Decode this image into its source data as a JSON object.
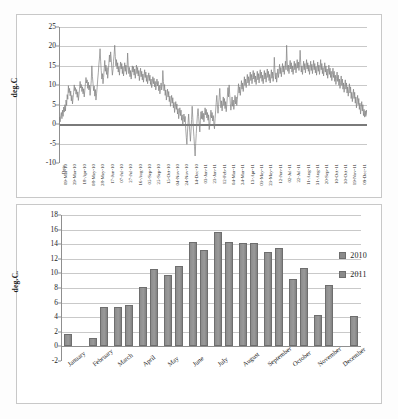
{
  "figure": {
    "charts": [
      {
        "id": "line-chart",
        "ylabel": "deg.C",
        "xlabel": "Date"
      },
      {
        "id": "bar-chart",
        "ylabel": "deg.C."
      }
    ]
  },
  "chart_data": [
    {
      "type": "line",
      "title": "",
      "xlabel": "Date",
      "ylabel": "deg.C",
      "ylim": [
        -10,
        25
      ],
      "yticks": [
        -10,
        -5,
        0,
        5,
        10,
        15,
        20,
        25
      ],
      "grid": true,
      "legend": "none",
      "series_color": "#808080",
      "tick_labels": [
        "09-Mar-10",
        "29-Mar-10",
        "18-Apr-10",
        "08-May-10",
        "28-May-10",
        "17-Jun-10",
        "07-Jul-10",
        "27-Jul-10",
        "16-Aug-10",
        "05-Sep-10",
        "25-Sep-10",
        "15-Oct-10",
        "04-Nov-10",
        "24-Nov-10",
        "14-Dec-10",
        "03-Jan-11",
        "23-Jan-11",
        "12-Feb-11",
        "04-Mar-11",
        "24-Mar-11",
        "13-Apr-11",
        "03-May-11",
        "23-May-11",
        "12-Jun-11",
        "02-Jul-11",
        "22-Jul-11",
        "11-Aug-11",
        "31-Aug-11",
        "20-Sep-11",
        "10-Oct-11",
        "30-Oct-11",
        "19-Nov-11",
        "09-Dec-11"
      ],
      "series": [
        {
          "name": "Daily mean temperature",
          "values": [
            -0.3,
            1.8,
            0.6,
            2.2,
            3.0,
            1.4,
            3.6,
            2.0,
            4.4,
            3.1,
            5.0,
            3.4,
            6.2,
            4.8,
            7.6,
            6.4,
            9.9,
            8.1,
            9.2,
            7.3,
            8.5,
            6.0,
            7.4,
            5.2,
            6.8,
            8.2,
            10.1,
            8.6,
            9.4,
            7.7,
            8.9,
            6.9,
            8.3,
            6.1,
            7.5,
            9.0,
            11.0,
            9.3,
            10.2,
            8.4,
            9.6,
            7.8,
            9.1,
            7.0,
            8.6,
            10.4,
            12.0,
            10.6,
            11.4,
            9.2,
            10.8,
            8.8,
            10.0,
            7.4,
            9.3,
            11.2,
            15.0,
            12.2,
            10.5,
            8.6,
            9.8,
            7.2,
            8.9,
            6.2,
            7.8,
            9.4,
            11.6,
            13.2,
            15.4,
            17.0,
            19.4,
            16.2,
            13.8,
            11.6,
            13.0,
            10.4,
            12.0,
            14.2,
            16.4,
            13.6,
            15.2,
            12.8,
            14.6,
            11.8,
            13.4,
            15.6,
            17.8,
            16.0,
            18.6,
            16.8,
            14.4,
            12.6,
            14.0,
            16.2,
            18.0,
            20.3,
            17.4,
            15.0,
            16.6,
            14.2,
            15.8,
            13.4,
            14.8,
            12.6,
            14.4,
            16.0,
            14.2,
            15.6,
            13.0,
            14.8,
            12.4,
            14.0,
            15.8,
            13.6,
            15.2,
            12.8,
            14.4,
            18.3,
            15.2,
            13.0,
            14.6,
            12.2,
            13.8,
            11.6,
            13.2,
            15.0,
            13.4,
            14.8,
            12.6,
            14.2,
            11.8,
            13.4,
            15.2,
            13.0,
            14.6,
            12.4,
            13.8,
            11.2,
            12.8,
            14.4,
            12.2,
            13.6,
            11.4,
            12.9,
            10.8,
            12.4,
            14.0,
            12.0,
            13.4,
            11.0,
            12.6,
            10.4,
            11.8,
            13.2,
            11.2,
            12.6,
            10.2,
            11.6,
            9.4,
            10.8,
            12.2,
            10.4,
            11.8,
            9.6,
            11.0,
            8.8,
            10.2,
            11.6,
            9.8,
            11.0,
            8.6,
            10.0,
            7.8,
            9.2,
            10.6,
            8.8,
            10.0,
            13.8,
            11.0,
            8.6,
            10.2,
            7.4,
            8.8,
            6.2,
            7.6,
            9.0,
            7.0,
            8.4,
            5.8,
            7.2,
            4.6,
            6.0,
            7.4,
            5.4,
            6.8,
            4.2,
            5.6,
            3.0,
            4.4,
            5.8,
            3.8,
            5.2,
            2.6,
            4.0,
            1.4,
            2.8,
            4.2,
            2.2,
            3.6,
            1.0,
            2.4,
            -0.2,
            1.2,
            2.6,
            0.6,
            2.0,
            -1.2,
            -3.4,
            -5.2,
            -2.0,
            0.4,
            2.6,
            0.0,
            -2.2,
            -4.4,
            -1.8,
            1.2,
            4.6,
            1.8,
            -1.0,
            -3.2,
            -5.8,
            -8.2,
            -5.0,
            -2.4,
            0.2,
            2.4,
            4.0,
            2.0,
            0.0,
            -2.0,
            1.0,
            3.2,
            1.4,
            3.4,
            1.2,
            2.8,
            0.6,
            2.2,
            4.2,
            2.4,
            3.8,
            1.6,
            3.0,
            1.0,
            2.4,
            -1.4,
            -0.2,
            1.8,
            3.6,
            1.6,
            3.0,
            0.8,
            2.2,
            0.0,
            -1.2,
            1.4,
            3.4,
            5.6,
            7.4,
            5.0,
            2.8,
            4.6,
            6.8,
            9.2,
            6.4,
            4.2,
            6.0,
            3.4,
            5.2,
            7.0,
            4.8,
            6.6,
            4.0,
            5.8,
            3.2,
            5.0,
            7.2,
            9.4,
            7.0,
            10.1,
            7.6,
            5.4,
            3.6,
            5.2,
            7.0,
            4.6,
            6.2,
            3.8,
            5.6,
            7.4,
            5.2,
            7.0,
            4.8,
            6.4,
            8.2,
            10.4,
            8.0,
            9.6,
            7.4,
            9.0,
            11.2,
            9.0,
            10.6,
            8.4,
            10.0,
            12.2,
            10.0,
            11.6,
            9.4,
            11.0,
            12.8,
            10.6,
            12.2,
            10.0,
            11.6,
            13.4,
            11.2,
            12.8,
            10.4,
            12.0,
            13.8,
            11.6,
            13.2,
            10.8,
            12.4,
            10.2,
            11.8,
            13.6,
            11.4,
            13.0,
            10.6,
            12.2,
            14.0,
            11.8,
            13.4,
            11.0,
            12.6,
            10.4,
            12.0,
            13.8,
            11.6,
            13.2,
            10.8,
            12.4,
            14.2,
            12.0,
            13.6,
            11.2,
            12.8,
            10.6,
            12.2,
            14.0,
            11.8,
            13.4,
            11.0,
            12.6,
            17.2,
            14.0,
            11.6,
            13.2,
            10.8,
            12.4,
            14.2,
            12.0,
            13.6,
            15.4,
            13.0,
            14.6,
            12.2,
            13.8,
            15.6,
            13.4,
            15.0,
            12.8,
            14.4,
            16.2,
            14.0,
            20.3,
            16.0,
            13.6,
            15.2,
            13.0,
            14.6,
            16.4,
            14.2,
            15.8,
            13.4,
            15.0,
            12.8,
            14.4,
            16.2,
            14.0,
            15.6,
            13.2,
            14.8,
            16.6,
            14.4,
            16.0,
            13.8,
            15.4,
            19.0,
            15.8,
            13.4,
            15.0,
            12.8,
            14.4,
            16.2,
            14.0,
            15.6,
            13.2,
            14.8,
            16.6,
            14.2,
            15.8,
            13.6,
            15.2,
            12.8,
            14.4,
            16.2,
            13.8,
            15.4,
            13.0,
            14.6,
            16.4,
            14.0,
            15.6,
            13.2,
            14.8,
            12.6,
            14.2,
            16.0,
            13.6,
            15.2,
            12.8,
            14.4,
            16.6,
            14.0,
            15.6,
            13.0,
            14.6,
            12.4,
            14.0,
            15.8,
            13.4,
            15.0,
            12.6,
            14.2,
            11.8,
            13.4,
            15.2,
            12.8,
            14.4,
            12.0,
            13.6,
            11.2,
            12.8,
            14.4,
            12.0,
            13.6,
            11.0,
            12.6,
            10.2,
            11.8,
            13.4,
            11.0,
            12.6,
            10.0,
            11.6,
            9.2,
            10.8,
            12.4,
            10.0,
            11.6,
            9.0,
            10.6,
            8.2,
            9.8,
            11.4,
            9.0,
            10.6,
            8.0,
            9.6,
            7.2,
            8.8,
            10.4,
            8.0,
            9.6,
            6.6,
            8.2,
            5.8,
            7.4,
            9.0,
            6.6,
            8.2,
            5.4,
            7.0,
            4.2,
            5.8,
            7.4,
            5.0,
            6.6,
            3.8,
            5.4,
            2.6,
            4.2,
            5.8,
            3.4,
            5.0,
            2.2,
            3.8,
            1.8,
            3.4,
            2.0,
            3.6,
            2.4
          ]
        }
      ]
    },
    {
      "type": "bar",
      "title": "",
      "xlabel": "",
      "ylabel": "deg.C.",
      "ylim": [
        -2,
        18
      ],
      "yticks": [
        -2,
        0,
        2,
        4,
        6,
        8,
        10,
        12,
        14,
        16,
        18
      ],
      "grid": true,
      "legend_position": "right",
      "categories": [
        "January",
        "February",
        "March",
        "April",
        "May",
        "June",
        "July",
        "August",
        "September",
        "October",
        "November",
        "December"
      ],
      "series": [
        {
          "name": "2010",
          "color": "#8a8a8a",
          "values": [
            1.7,
            1.2,
            5.35,
            8.15,
            9.8,
            14.3,
            15.65,
            14.15,
            13.0,
            9.3,
            4.35,
            null
          ]
        },
        {
          "name": "2011",
          "color": "#8a8a8a",
          "values": [
            null,
            5.35,
            5.7,
            10.6,
            11.0,
            13.25,
            14.25,
            14.1,
            13.55,
            10.8,
            8.4,
            4.1
          ]
        }
      ]
    }
  ]
}
